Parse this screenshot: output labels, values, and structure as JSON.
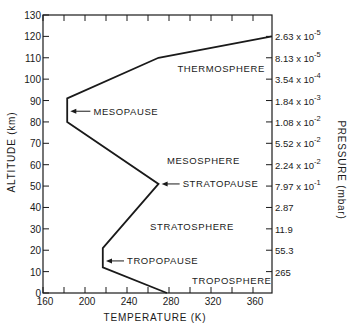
{
  "chart_data": {
    "type": "line",
    "title": "",
    "xlabel": "TEMPERATURE (K)",
    "ylabel": "ALTITUDE (km)",
    "y2label": "PRESSURE (mbar)",
    "xlim": [
      160,
      378
    ],
    "ylim": [
      0,
      130
    ],
    "x_ticks": [
      160,
      200,
      240,
      280,
      320,
      360
    ],
    "x_minor_step": 20,
    "y_ticks": [
      0,
      10,
      20,
      30,
      40,
      50,
      60,
      70,
      80,
      90,
      100,
      110,
      120,
      130
    ],
    "grid": false,
    "series": [
      {
        "name": "Temperature profile",
        "points": [
          {
            "temp_k": 278,
            "alt_km": 0
          },
          {
            "temp_k": 217,
            "alt_km": 12
          },
          {
            "temp_k": 217,
            "alt_km": 21
          },
          {
            "temp_k": 270,
            "alt_km": 51
          },
          {
            "temp_k": 183,
            "alt_km": 80
          },
          {
            "temp_k": 183,
            "alt_km": 91
          },
          {
            "temp_k": 270,
            "alt_km": 110
          },
          {
            "temp_k": 378,
            "alt_km": 120
          }
        ]
      }
    ],
    "pressure_ticks": [
      {
        "alt_km": 120,
        "mantissa": "2.63",
        "exp": "-5"
      },
      {
        "alt_km": 110,
        "mantissa": "8.13",
        "exp": "-5"
      },
      {
        "alt_km": 100,
        "mantissa": "3.54",
        "exp": "-4"
      },
      {
        "alt_km": 90,
        "mantissa": "1.84",
        "exp": "-3"
      },
      {
        "alt_km": 80,
        "mantissa": "1.08",
        "exp": "-2"
      },
      {
        "alt_km": 70,
        "mantissa": "5.52",
        "exp": "-2"
      },
      {
        "alt_km": 60,
        "mantissa": "2.24",
        "exp": "-2"
      },
      {
        "alt_km": 50,
        "mantissa": "7.97",
        "exp": "-1"
      },
      {
        "alt_km": 40,
        "mantissa": "2.87",
        "exp": ""
      },
      {
        "alt_km": 30,
        "mantissa": "11.9",
        "exp": ""
      },
      {
        "alt_km": 20,
        "mantissa": "55.3",
        "exp": ""
      },
      {
        "alt_km": 10,
        "mantissa": "265",
        "exp": ""
      }
    ],
    "annotations": [
      {
        "text": "THERMOSPHERE",
        "temp_k": 288,
        "alt_km": 105,
        "arrow": false
      },
      {
        "text": "MESOPAUSE",
        "temp_k": 208,
        "alt_km": 85,
        "arrow": true,
        "arrow_to_k": 186
      },
      {
        "text": "MESOSPHERE",
        "temp_k": 278,
        "alt_km": 62,
        "arrow": false
      },
      {
        "text": "STRATOPAUSE",
        "temp_k": 293,
        "alt_km": 51,
        "arrow": true,
        "arrow_to_k": 273
      },
      {
        "text": "STRATOSPHERE",
        "temp_k": 262,
        "alt_km": 31,
        "arrow": false
      },
      {
        "text": "TROPOPAUSE",
        "temp_k": 240,
        "alt_km": 15,
        "arrow": true,
        "arrow_to_k": 220
      },
      {
        "text": "TROPOSPHERE",
        "temp_k": 302,
        "alt_km": 6,
        "arrow": false
      }
    ]
  },
  "axis": {
    "x_title": "TEMPERATURE (K)",
    "y_title": "ALTITUDE (km)",
    "y2_title": "PRESSURE (mbar)"
  }
}
